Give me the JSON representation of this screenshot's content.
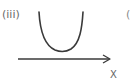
{
  "diagram": {
    "part_label": "(iii)",
    "axis_label": "X",
    "next_part_label_partial": "(",
    "curve": {
      "shape": "U-shaped (concave up) curve",
      "description": "Curve above the x-axis with a minimum, not touching the axis"
    },
    "axis": {
      "direction": "right",
      "has_arrowhead": true
    },
    "colors": {
      "stroke": "#3a3a3a",
      "text": "#6a6a6a",
      "background": "#ffffff"
    }
  }
}
